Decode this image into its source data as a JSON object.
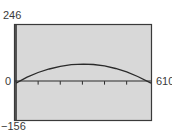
{
  "chart_data": {
    "type": "line",
    "title": "",
    "xlabel": "",
    "ylabel": "",
    "xlim": [
      0,
      610
    ],
    "ylim": [
      -156,
      246
    ],
    "x_ticks": [
      100,
      200,
      300,
      400,
      500
    ],
    "grid": false,
    "legend": null,
    "series": [
      {
        "name": "curve",
        "x": [
          0,
          50,
          100,
          150,
          200,
          250,
          305,
          350,
          400,
          450,
          500,
          550,
          610
        ],
        "y": [
          0,
          25,
          45,
          60,
          71,
          78,
          80,
          79,
          73,
          62,
          48,
          28,
          0
        ]
      }
    ],
    "window_labels": {
      "ymax": "246",
      "ymin": "−156",
      "xmin": "0",
      "xmax": "610"
    },
    "colors": {
      "background": "#d8d8d8",
      "frame": "#3a3a3a",
      "curve": "#2a2a2a"
    }
  }
}
